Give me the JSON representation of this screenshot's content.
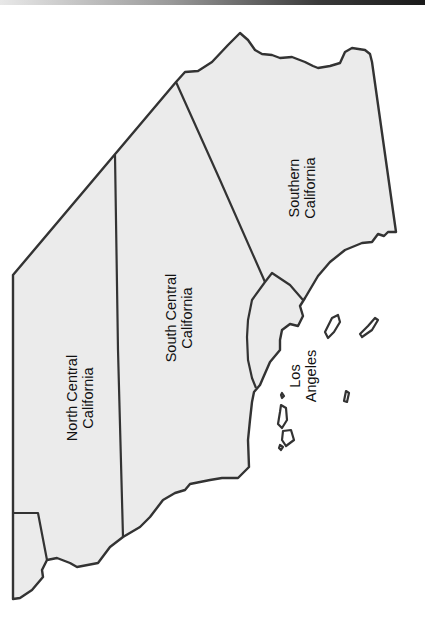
{
  "map": {
    "colors": {
      "land": "#ebebeb",
      "border": "#333333",
      "water": "#ffffff",
      "label": "#111111"
    },
    "regions": [
      {
        "id": "north-central",
        "lines": [
          "North Central",
          "California"
        ]
      },
      {
        "id": "south-central",
        "lines": [
          "South Central",
          "California"
        ]
      },
      {
        "id": "southern",
        "lines": [
          "Southern",
          "California"
        ]
      },
      {
        "id": "los-angeles",
        "lines": [
          "Los",
          "Angeles"
        ]
      }
    ]
  }
}
